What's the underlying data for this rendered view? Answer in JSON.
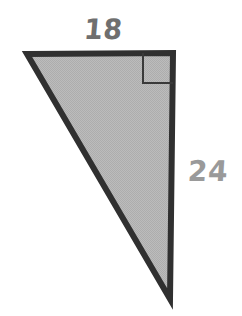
{
  "figure": {
    "kind": "right-triangle-diagram",
    "background_color": "#ffffff",
    "shape": {
      "name": "right-triangle",
      "fill_color": "#b9b9b9",
      "stroke_color": "#303030",
      "stroke_width": 6,
      "vertices": {
        "top_left": [
          27,
          54
        ],
        "top_right": [
          173,
          53
        ],
        "bottom_right": [
          170,
          299
        ]
      }
    },
    "right_angle_marker": {
      "name": "right-angle-square",
      "corner": "top-right",
      "size": 30,
      "stroke_color": "#3a3a3a",
      "stroke_width": 2
    },
    "labels": [
      {
        "id": "top",
        "text": "18",
        "side": "top-leg",
        "color": "#6f6f6f",
        "x": 84,
        "y": 16,
        "font_size": 27
      },
      {
        "id": "right",
        "text": "24",
        "side": "right-leg",
        "color": "#9a9a9a",
        "x": 188,
        "y": 158,
        "font_size": 28
      }
    ]
  }
}
